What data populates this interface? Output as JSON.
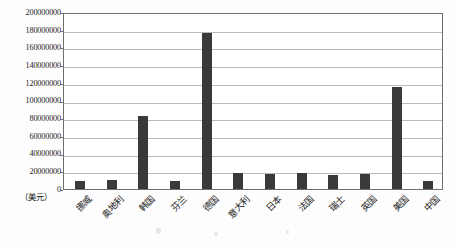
{
  "chart_data": {
    "type": "bar",
    "title": "",
    "xlabel": "",
    "ylabel": "（美元）",
    "ylim": [
      0,
      200000000
    ],
    "ytick_step": 20000000,
    "grid": true,
    "legend": "none",
    "bar_color": "#3a3a3a",
    "categories": [
      "挪威",
      "奥地利",
      "韩国",
      "芬兰",
      "德国",
      "意大利",
      "日本",
      "法国",
      "瑞士",
      "英国",
      "美国",
      "中国"
    ],
    "values": [
      9000000,
      10000000,
      82000000,
      9000000,
      176000000,
      18000000,
      17000000,
      18000000,
      16000000,
      17000000,
      115000000,
      9000000
    ],
    "ytick_labels": [
      "200000000",
      "180000000",
      "160000000",
      "140000000",
      "120000000",
      "100000000",
      "80000000",
      "60000000",
      "40000000",
      "20000000",
      "0"
    ],
    "ytick_values": [
      200000000,
      180000000,
      160000000,
      140000000,
      120000000,
      100000000,
      80000000,
      60000000,
      40000000,
      20000000,
      0
    ]
  }
}
